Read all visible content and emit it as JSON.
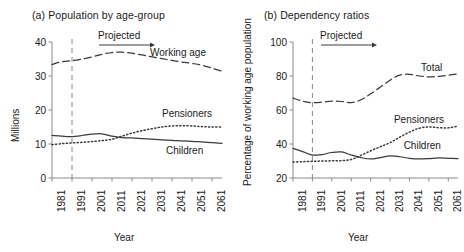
{
  "figure": {
    "width": 464,
    "height": 252,
    "background": "#ffffff",
    "line_color": "#3a3a3a",
    "axis_color": "#8a8a8a",
    "text_color": "#1a1a1a"
  },
  "panels": [
    {
      "id": "a",
      "title": "(a) Population by age-group",
      "projected_label": "Projected",
      "labels": {
        "working_age": "Working age",
        "pensioners": "Pensioners",
        "children": "Children"
      }
    },
    {
      "id": "b",
      "title": "(b) Dependency ratios",
      "projected_label": "Projected",
      "labels": {
        "total": "Total",
        "pensioners": "Pensioners",
        "children": "Children"
      }
    }
  ],
  "chart_data": [
    {
      "type": "line",
      "panel": "a",
      "title": "(a) Population by age-group",
      "xlabel": "Year",
      "ylabel": "Millions",
      "xlim": [
        1981,
        2066
      ],
      "ylim": [
        0,
        40
      ],
      "xticks": [
        1981,
        1991,
        2001,
        2011,
        2021,
        2031,
        2041,
        2051,
        2061
      ],
      "xticklabels": [
        "1981",
        "1991",
        "2001",
        "2011",
        "2021",
        "2031",
        "2041",
        "2051",
        "2061"
      ],
      "yticks": [
        0,
        10,
        20,
        30,
        40
      ],
      "yticklabels": [
        "0",
        "10",
        "20",
        "30",
        "40"
      ],
      "grid": false,
      "legend": "inline-annotations",
      "projection_start": 1991,
      "projection_marker": "vertical dashed line at 1991",
      "annotations": [
        {
          "text": "Projected",
          "x": 2006,
          "y": 40,
          "arrow": "right"
        },
        {
          "text": "Working age",
          "x": 2036,
          "y": 37.3
        },
        {
          "text": "Pensioners",
          "x": 2043,
          "y": 19.5
        },
        {
          "text": "Children",
          "x": 2043,
          "y": 8.8
        }
      ],
      "x": [
        1981,
        1986,
        1991,
        1996,
        2001,
        2006,
        2011,
        2016,
        2021,
        2026,
        2031,
        2036,
        2041,
        2046,
        2051,
        2056,
        2061,
        2066
      ],
      "series": [
        {
          "name": "Working age",
          "style": "dashed",
          "values": [
            33.4,
            34.2,
            34.5,
            35.0,
            35.6,
            36.4,
            36.9,
            37.0,
            36.7,
            36.2,
            35.6,
            35.1,
            34.6,
            34.1,
            33.7,
            33.2,
            32.3,
            31.4
          ]
        },
        {
          "name": "Pensioners",
          "style": "dotted",
          "values": [
            9.8,
            10.1,
            10.3,
            10.5,
            10.7,
            11.0,
            11.4,
            12.3,
            13.2,
            13.9,
            14.5,
            15.0,
            15.3,
            15.4,
            15.3,
            15.1,
            15.0,
            15.0
          ]
        },
        {
          "name": "Children",
          "style": "solid",
          "values": [
            12.5,
            12.3,
            12.2,
            12.5,
            12.9,
            13.0,
            12.3,
            11.9,
            11.8,
            11.6,
            11.4,
            11.2,
            11.1,
            10.9,
            10.8,
            10.6,
            10.4,
            10.2
          ]
        }
      ]
    },
    {
      "type": "line",
      "panel": "b",
      "title": "(b) Dependency ratios",
      "xlabel": "Year",
      "ylabel": "Percentage of working age population",
      "xlim": [
        1981,
        2066
      ],
      "ylim": [
        20,
        100
      ],
      "xticks": [
        1981,
        1991,
        2001,
        2011,
        2021,
        2031,
        2041,
        2051,
        2061
      ],
      "xticklabels": [
        "1981",
        "1991",
        "2001",
        "2011",
        "2021",
        "2031",
        "2041",
        "2051",
        "2061"
      ],
      "yticks": [
        20,
        40,
        60,
        80,
        100
      ],
      "yticklabels": [
        "20",
        "40",
        "60",
        "80",
        "100"
      ],
      "grid": false,
      "legend": "inline-annotations",
      "projection_start": 1991,
      "projection_marker": "vertical dashed line at 1991",
      "annotations": [
        {
          "text": "Projected",
          "x": 2006,
          "y": 100,
          "arrow": "right"
        },
        {
          "text": "Total",
          "x": 2049,
          "y": 86
        },
        {
          "text": "Pensioners",
          "x": 2040,
          "y": 56
        },
        {
          "text": "Children",
          "x": 2044,
          "y": 41
        }
      ],
      "x": [
        1981,
        1986,
        1991,
        1996,
        2001,
        2006,
        2011,
        2016,
        2021,
        2026,
        2031,
        2036,
        2041,
        2046,
        2051,
        2056,
        2061,
        2066
      ],
      "series": [
        {
          "name": "Total",
          "style": "dashed",
          "values": [
            67.0,
            65.2,
            64.3,
            64.6,
            65.2,
            65.0,
            64.3,
            66.0,
            69.5,
            73.5,
            77.5,
            80.5,
            81.0,
            80.0,
            79.5,
            79.8,
            80.5,
            81.2
          ]
        },
        {
          "name": "Pensioners",
          "style": "dotted",
          "values": [
            29.4,
            29.6,
            29.8,
            30.0,
            30.1,
            30.2,
            30.9,
            33.3,
            36.0,
            38.4,
            40.8,
            44.0,
            47.0,
            49.3,
            50.0,
            49.6,
            49.5,
            50.5
          ]
        },
        {
          "name": "Children",
          "style": "solid",
          "values": [
            37.4,
            35.5,
            33.5,
            33.8,
            35.0,
            35.3,
            33.5,
            32.0,
            31.2,
            32.0,
            33.0,
            32.5,
            31.6,
            31.2,
            31.4,
            31.8,
            31.6,
            31.4
          ]
        }
      ]
    }
  ]
}
